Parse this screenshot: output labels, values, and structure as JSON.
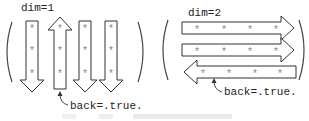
{
  "left_panel": {
    "label": "dim=1",
    "annotation": "back=.true.",
    "columns": [
      {
        "direction": "down",
        "cells": [
          "*",
          "*",
          "*"
        ]
      },
      {
        "direction": "up",
        "cells": [
          "*",
          "*",
          "*"
        ]
      },
      {
        "direction": "down",
        "cells": [
          "*",
          "*",
          "*"
        ]
      },
      {
        "direction": "down",
        "cells": [
          "*",
          "*",
          "*"
        ]
      }
    ]
  },
  "right_panel": {
    "label": "dim=2",
    "annotation": "back=.true.",
    "rows": [
      {
        "direction": "right",
        "cells": [
          "*",
          "*",
          "*",
          "*"
        ]
      },
      {
        "direction": "right",
        "cells": [
          "*",
          "*",
          "*",
          "*"
        ]
      },
      {
        "direction": "left",
        "cells": [
          "*",
          "*",
          "*",
          "*"
        ]
      }
    ]
  },
  "colors": {
    "stroke": "#333333",
    "star": "#888888"
  }
}
